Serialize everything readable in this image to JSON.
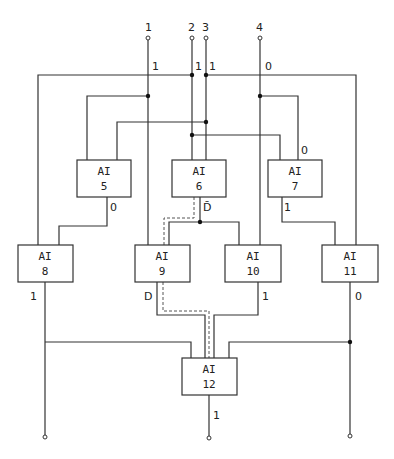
{
  "inputs": [
    {
      "id": "1",
      "label": "1",
      "value": "1"
    },
    {
      "id": "2",
      "label": "2",
      "value": "1"
    },
    {
      "id": "3",
      "label": "3",
      "value": "1"
    },
    {
      "id": "4",
      "label": "4",
      "value": "0"
    }
  ],
  "gates": [
    {
      "type": "AI",
      "number": "5",
      "output": "0"
    },
    {
      "type": "AI",
      "number": "6",
      "output": "D̄"
    },
    {
      "type": "AI",
      "number": "7",
      "output": "1"
    },
    {
      "type": "AI",
      "number": "8",
      "output": "1"
    },
    {
      "type": "AI",
      "number": "9",
      "output": "D"
    },
    {
      "type": "AI",
      "number": "10",
      "output": "1"
    },
    {
      "type": "AI",
      "number": "11",
      "output": "0"
    },
    {
      "type": "AI",
      "number": "12",
      "output": "1"
    }
  ],
  "annotations": {
    "gate7_input": "0"
  },
  "colors": {
    "line": "#333333",
    "background": "#ffffff"
  }
}
